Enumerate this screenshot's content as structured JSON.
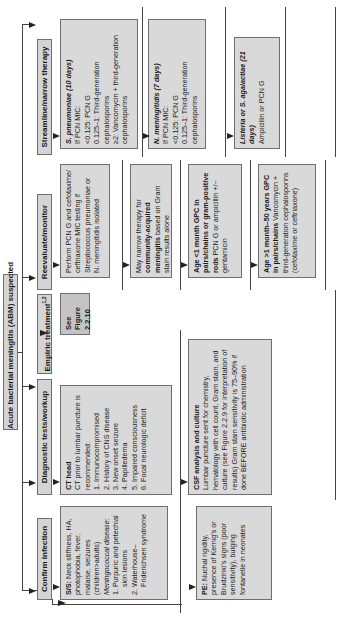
{
  "title": "Acute bacterial meningitis (ABM) suspected",
  "columns": {
    "confirm": {
      "header": "Confirm infection",
      "boxes": {
        "ss": {
          "label": "S/S:",
          "text": "Neck stiffness, HA, photophobia, fever, malaise, seizures (children>adults)",
          "subhead": "Meningococcal disease:",
          "items": [
            "1. Purpuric and petechial skin lesions",
            "2. Waterhouse–Friderichsen syndrome"
          ]
        },
        "pe": {
          "label": "PE:",
          "text": "Nuchal rigidity, presence of Kernig's or Brudzinki's signs (poor sensitivity), bulging fontanelle in neonates"
        }
      }
    },
    "diagnostic": {
      "header": "Diagnostic tests/workup",
      "boxes": {
        "ct": {
          "title": "CT head",
          "text": "CT prior to lumbar puncture is recommended:",
          "items": [
            "1. Immunocompromised",
            "2. History of CNS disease",
            "3. New onset seizure",
            "4. Papilledema",
            "5. Impaired consciousness",
            "6. Focal neurologic deficit"
          ]
        },
        "csf": {
          "title": "CSF analysis and culture",
          "text": "Lumbar puncture sent for chemistry, hematology with cell count, Gram stain, and culture (see Figure 2.2.9 for interpretation of results) Gram stain sensitivity is 75–90% if done BEFORE antibiotic administration"
        }
      }
    },
    "empiric": {
      "header": "Empiric treatment",
      "header_sup": "1,2",
      "boxes": {
        "see": {
          "text": "See Figure 2.2.10"
        }
      }
    },
    "reevaluate": {
      "header": "Reevaluate/monitor",
      "boxes": {
        "pcn": {
          "text": "Perform PCN G and cefotaxime/ ceftriaxone MIC testing if Streptococcus pneumoniae or N. meningitidis isolated"
        },
        "narrow": {
          "pre": "May narrow therapy for",
          "bold": "community-acquired meningitis",
          "post": "based on Gram stain results alone"
        },
        "age1": {
          "bold": "Age <1 month GPC in pairs/chains or gram-positive rods",
          "post": "PCN G or ampicillin +/− gentamicin"
        },
        "age2": {
          "bold": "Age >1 month–50 years GPC in pairs/chains",
          "post": "Vancomycin + third-generation cephalosporins (cefotaxime or ceftriaxone)"
        }
      }
    },
    "streamline": {
      "header": "Streamline/narrow therapy",
      "boxes": {
        "spn": {
          "title": "S. pneumoniae (10 days)",
          "items": [
            "If PCN MIC:",
            "<0.125: PCN G",
            "0.125–1: Third-generation cephalosporins",
            "≥2: Vancomycin + third-generation cephalosporins"
          ]
        },
        "nm": {
          "title": "N. meningitidis (7 days)",
          "items": [
            "If PCN MIC:",
            "<0.125: PCN G",
            "0.125–1: Third-generation cephalosporins"
          ]
        },
        "lis": {
          "title": "Listeria or S. agalactiae (21 days)",
          "text": "Ampicillin or PCN G"
        }
      }
    }
  },
  "colors": {
    "box_fill": "#d9d9d9",
    "dark_box_fill": "#c4c4c4",
    "border": "#6e6e6e",
    "line": "#444444"
  }
}
